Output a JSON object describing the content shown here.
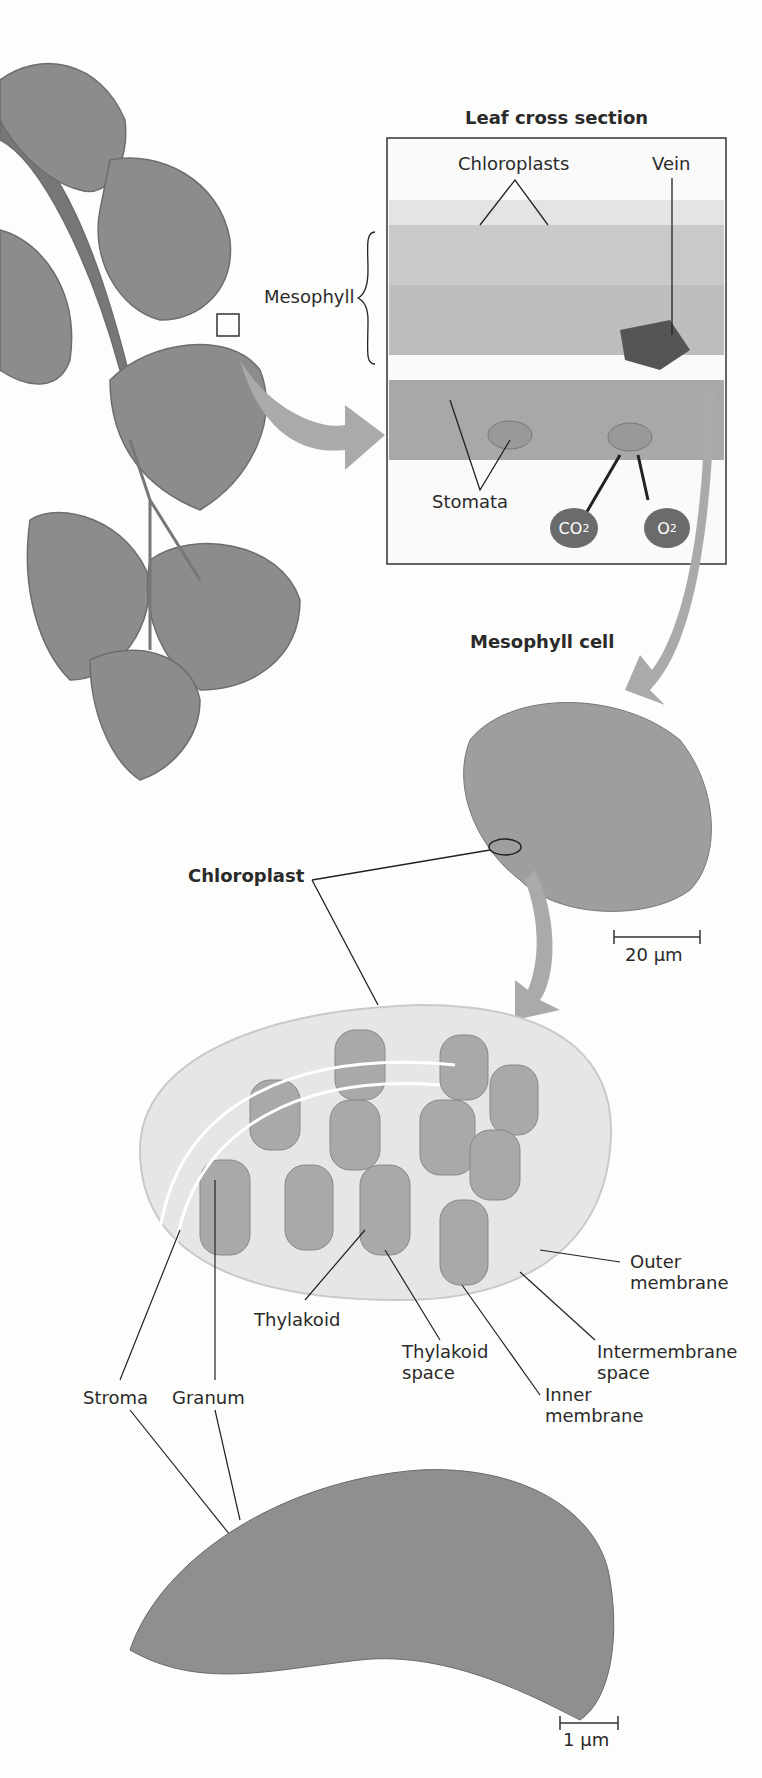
{
  "titles": {
    "leaf_cross_section": "Leaf cross section",
    "mesophyll_cell": "Mesophyll cell",
    "chloroplast": "Chloroplast"
  },
  "labels": {
    "chloroplasts": "Chloroplasts",
    "vein": "Vein",
    "mesophyll": "Mesophyll",
    "stomata": "Stomata",
    "co2": "CO",
    "co2_sub": "2",
    "o2": "O",
    "o2_sub": "2",
    "outer_membrane_1": "Outer",
    "outer_membrane_2": "membrane",
    "intermembrane_1": "Intermembrane",
    "intermembrane_2": "space",
    "inner_membrane_1": "Inner",
    "inner_membrane_2": "membrane",
    "thylakoid": "Thylakoid",
    "thylakoid_space_1": "Thylakoid",
    "thylakoid_space_2": "space",
    "stroma": "Stroma",
    "granum": "Granum"
  },
  "scale_bars": {
    "cell": "20 µm",
    "chloroplast_tem": "1 µm"
  },
  "colors": {
    "leaf": "#8a8a8a",
    "arrow": "#b0b0b0",
    "molecule": "#6b6b6b"
  }
}
